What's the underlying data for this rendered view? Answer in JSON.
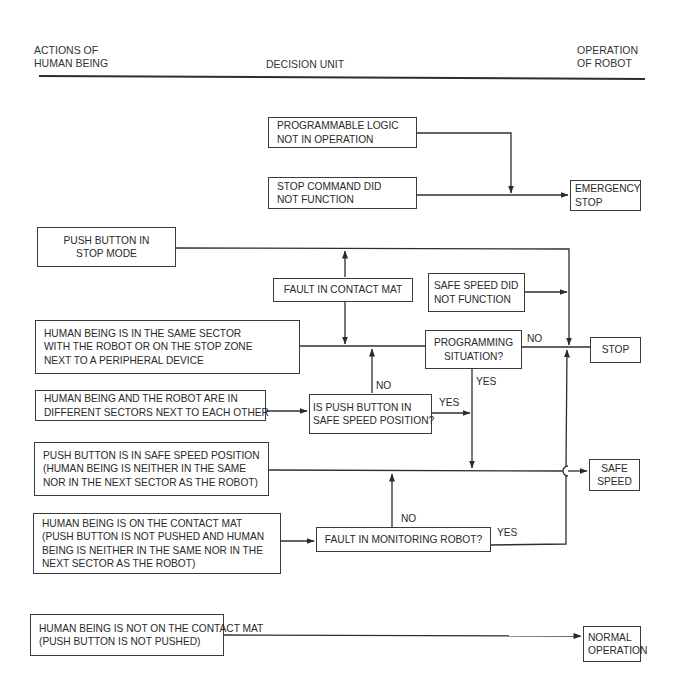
{
  "header": {
    "left": [
      "ACTIONS OF",
      "HUMAN BEING"
    ],
    "center": "DECISION UNIT",
    "right": [
      "OPERATION",
      "OF ROBOT"
    ]
  },
  "nodes": {
    "programmable_logic": [
      "PROGRAMMABLE LOGIC",
      "NOT IN OPERATION"
    ],
    "stop_command": [
      "STOP COMMAND DID",
      "NOT FUNCTION"
    ],
    "emergency_stop": [
      "EMERGENCY",
      "STOP"
    ],
    "push_button_stop": [
      "PUSH BUTTON IN",
      "STOP MODE"
    ],
    "fault_contact_mat": [
      "FAULT IN CONTACT MAT"
    ],
    "safe_speed_did_not": [
      "SAFE SPEED DID",
      "NOT FUNCTION"
    ],
    "human_same_sector": [
      "HUMAN BEING IS IN THE SAME SECTOR",
      "WITH THE ROBOT OR ON THE STOP ZONE",
      "NEXT TO A PERIPHERAL DEVICE"
    ],
    "programming_situation": [
      "PROGRAMMING",
      "SITUATION?"
    ],
    "stop": [
      "STOP"
    ],
    "different_sectors": [
      "HUMAN BEING AND THE ROBOT ARE IN",
      "DIFFERENT SECTORS NEXT TO EACH OTHER"
    ],
    "push_button_safe_q": [
      "IS PUSH BUTTON IN",
      "SAFE SPEED POSITION?"
    ],
    "safe_speed_position": [
      "PUSH BUTTON IS IN SAFE SPEED POSITION",
      "(HUMAN BEING IS NEITHER IN THE SAME",
      "NOR IN THE NEXT SECTOR AS THE ROBOT)"
    ],
    "safe_speed": [
      "SAFE",
      "SPEED"
    ],
    "on_contact_mat": [
      "HUMAN BEING IS ON THE CONTACT MAT",
      "(PUSH BUTTON IS NOT PUSHED AND HUMAN",
      "BEING IS NEITHER IN THE SAME NOR IN THE",
      "NEXT SECTOR AS THE ROBOT)"
    ],
    "fault_monitoring": [
      "FAULT IN MONITORING ROBOT?"
    ],
    "not_on_contact_mat": [
      "HUMAN BEING IS NOT ON THE CONTACT MAT",
      "(PUSH BUTTON IS NOT PUSHED)"
    ],
    "normal_operation": [
      "NORMAL",
      "OPERATION"
    ]
  },
  "edge_labels": {
    "prog_no": "NO",
    "prog_yes": "YES",
    "push_no": "NO",
    "push_yes": "YES",
    "monitor_no": "NO",
    "monitor_yes": "YES"
  }
}
